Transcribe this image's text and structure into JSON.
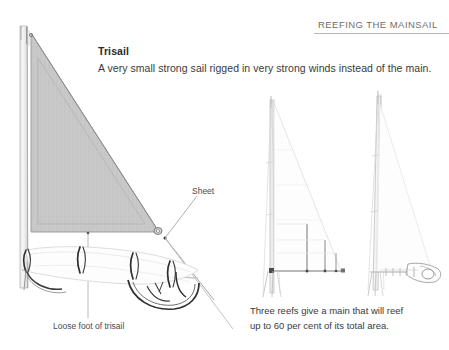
{
  "page": {
    "width": 449,
    "height": 350,
    "background": "#ffffff"
  },
  "header": {
    "title": "REEFING THE MAINSAIL",
    "rule_color": "#b9b9b9"
  },
  "main": {
    "heading": "Trisail",
    "description": "A very small strong sail rigged in very strong winds instead of the main.",
    "labels": {
      "sheet": "Sheet",
      "loose_foot": "Loose foot of trisail"
    }
  },
  "caption": {
    "line1": "Three reefs give a main that will reef",
    "line2": "up to 60 per cent of its total area."
  },
  "colors": {
    "sail_fill": "#c9c9c9",
    "sail_stroke": "#9a9a9a",
    "mast": "#d6d6d6",
    "mast_stroke": "#a8a8a8",
    "line": "#8d8d8d",
    "faint": "#dcdcdc",
    "dark_detail": "#2e2e2e",
    "text": "#3a3a3a",
    "header_text": "#6e6e6e"
  },
  "diagrams": {
    "left": {
      "name": "trisail-rigged-diagram",
      "mast_top_y": 26,
      "mast_base_y": 288,
      "sail_head": [
        30,
        33
      ],
      "sail_tack": [
        30,
        232
      ],
      "sail_clew": [
        160,
        232
      ]
    },
    "middle": {
      "name": "mainsail-reef-outline-diagram",
      "reef_count": 3
    },
    "right": {
      "name": "mainsail-reefed-boom-diagram",
      "reef_count": 3
    }
  }
}
